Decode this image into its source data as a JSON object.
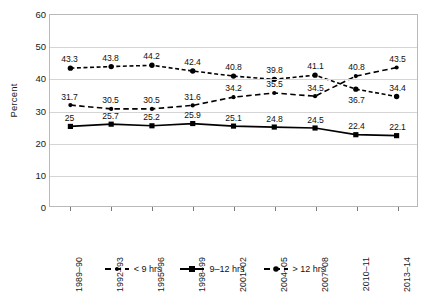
{
  "chart_data": {
    "type": "line",
    "title": "",
    "xlabel": "",
    "ylabel": "Percent",
    "ylim": [
      0,
      60
    ],
    "yticks": [
      0,
      10,
      20,
      30,
      40,
      50,
      60
    ],
    "grid": true,
    "legend_position": "bottom",
    "categories": [
      "1989–90",
      "1992–93",
      "1995–96",
      "1998–99",
      "2001–02",
      "2004–05",
      "2007–08",
      "2010–11",
      "2013–14"
    ],
    "series": [
      {
        "name": "< 9 hrs",
        "marker": "small-dot",
        "dash": "long-dash",
        "values": [
          31.7,
          30.5,
          30.5,
          31.6,
          34.2,
          35.5,
          34.5,
          40.8,
          43.5
        ],
        "label_positions": [
          "above",
          "above",
          "above",
          "above",
          "above",
          "above",
          "above",
          "above",
          "above"
        ]
      },
      {
        "name": "9–12 hrs",
        "marker": "square",
        "dash": "solid",
        "values": [
          25,
          25.7,
          25.2,
          25.9,
          25.1,
          24.8,
          24.5,
          22.4,
          22.1
        ],
        "label_positions": [
          "above",
          "above",
          "above",
          "above",
          "above",
          "above",
          "above",
          "above",
          "above"
        ]
      },
      {
        "name": "> 12 hrs",
        "marker": "dot",
        "dash": "short-dash",
        "values": [
          43.3,
          43.8,
          44.2,
          42.4,
          40.8,
          39.8,
          41.1,
          36.7,
          34.4
        ],
        "label_positions": [
          "above",
          "above",
          "above",
          "above",
          "above",
          "above",
          "above",
          "below",
          "above"
        ]
      }
    ],
    "colors": {
      "series": "#000000",
      "grid": "#d5d5d5",
      "axis": "#b9b9b9",
      "text": "#111111"
    }
  }
}
